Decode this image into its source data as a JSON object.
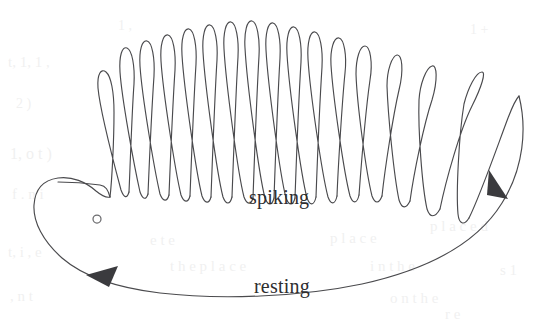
{
  "figure": {
    "width": 554,
    "height": 322,
    "background_color": "#ffffff",
    "title": "",
    "stroke_color": "#4a4a4d",
    "arrow_color": "#3b3b3e",
    "marker_color": "#6b6b6e"
  },
  "labels": {
    "spiking": "spiking",
    "resting": "resting"
  },
  "chart_data": {
    "type": "line",
    "title": "",
    "xlabel": "",
    "ylabel": "",
    "grid": false,
    "legend_position": "inline-annotations",
    "annotations": [
      {
        "text": "spiking",
        "x": 286,
        "y": 198
      },
      {
        "text": "resting",
        "x": 292,
        "y": 287
      }
    ],
    "markers": [
      {
        "name": "fixed-point",
        "shape": "open-circle",
        "x": 97,
        "y": 219,
        "radius": 4
      }
    ],
    "direction_arrows": [
      {
        "name": "resting-branch-arrow",
        "x": 103,
        "y": 277,
        "angle_deg": 196
      },
      {
        "name": "spiking-branch-arrow",
        "x": 500,
        "y": 185,
        "angle_deg": 58
      }
    ],
    "spike_count": 16,
    "spike_tips_y": [
      75,
      48,
      40,
      34,
      28,
      26,
      23,
      22,
      24,
      27,
      31,
      36,
      43,
      52,
      62,
      78
    ],
    "spike_base_y": [
      192,
      196,
      198,
      199,
      200,
      200,
      200,
      200,
      200,
      199,
      198,
      197,
      196,
      200,
      208,
      216
    ],
    "spike_x": [
      108,
      133,
      155,
      177,
      198,
      219,
      240,
      261,
      281,
      302,
      322,
      342,
      363,
      385,
      410,
      440
    ],
    "xlim": [
      0,
      554
    ],
    "ylim": [
      0,
      322
    ]
  },
  "ghost_background_text": [
    {
      "text": "t, 1, 1 ,",
      "x": 8,
      "y": 54,
      "size": 15
    },
    {
      "text": "1 ,",
      "x": 118,
      "y": 18,
      "size": 14
    },
    {
      "text": "1 +",
      "x": 470,
      "y": 22,
      "size": 14
    },
    {
      "text": "1, o t )",
      "x": 10,
      "y": 145,
      "size": 16
    },
    {
      "text": "2  )",
      "x": 16,
      "y": 96,
      "size": 14
    },
    {
      "text": "f    . n i",
      "x": 12,
      "y": 186,
      "size": 15
    },
    {
      "text": "t, i , e",
      "x": 8,
      "y": 244,
      "size": 15
    },
    {
      "text": ", n t",
      "x": 10,
      "y": 288,
      "size": 15
    },
    {
      "text": "e t e",
      "x": 150,
      "y": 232,
      "size": 15
    },
    {
      "text": "p l a c e",
      "x": 330,
      "y": 230,
      "size": 15
    },
    {
      "text": "t h e   p l a c e",
      "x": 170,
      "y": 258,
      "size": 15
    },
    {
      "text": "i n   t h e",
      "x": 370,
      "y": 258,
      "size": 15
    },
    {
      "text": "o n   t h e",
      "x": 390,
      "y": 290,
      "size": 15
    },
    {
      "text": "p l a c e d",
      "x": 430,
      "y": 218,
      "size": 15
    },
    {
      "text": "r e",
      "x": 445,
      "y": 306,
      "size": 15
    },
    {
      "text": "s   1",
      "x": 500,
      "y": 262,
      "size": 15
    }
  ]
}
